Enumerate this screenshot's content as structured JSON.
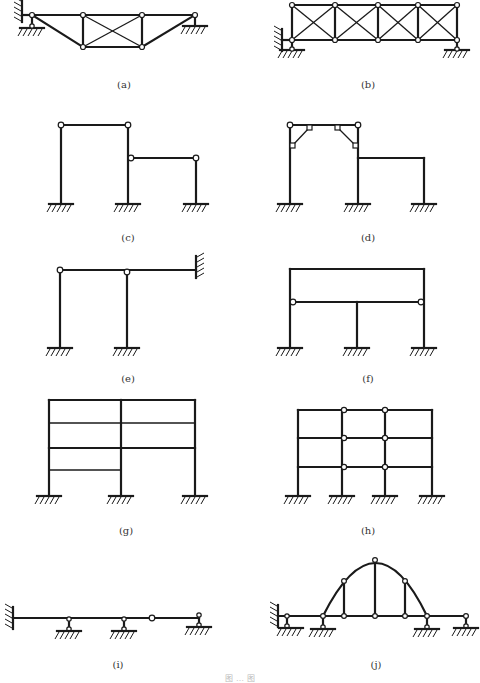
{
  "figure": {
    "caption": "图 … 图",
    "panels": [
      {
        "id": "a",
        "label": "(a)",
        "type": "truss",
        "description": "Truss with trapezoidal profile, X-braced middle panel, pinned support with horizontal link at left, roller at right"
      },
      {
        "id": "b",
        "label": "(b)",
        "type": "truss",
        "description": "Four-panel X-braced parallel chord truss, left support with horizontal link and vertical link, right roller"
      },
      {
        "id": "c",
        "label": "(c)",
        "type": "frame",
        "description": "Two-bay stepped frame with fixed column bases, hinged beam ends"
      },
      {
        "id": "d",
        "label": "(d)",
        "type": "frame",
        "description": "Two-bay stepped frame with knee braces in left bay, hinged top corners"
      },
      {
        "id": "e",
        "label": "(e)",
        "type": "frame",
        "description": "Beam fixed at right wall, supported on two fixed-base columns with hinges"
      },
      {
        "id": "f",
        "label": "(f)",
        "type": "frame",
        "description": "Two-story frame, three fixed-base columns, hinged lower beam at outer columns"
      },
      {
        "id": "g",
        "label": "(g)",
        "type": "frame",
        "description": "Two-bay multi-story frame with uneven floor levels, fixed bases"
      },
      {
        "id": "h",
        "label": "(h)",
        "type": "frame",
        "description": "Three-bay three-story frame with hinged middle-bay beams, fixed bases"
      },
      {
        "id": "i",
        "label": "(i)",
        "type": "beam",
        "description": "Continuous beam fixed at left wall, three link supports, one internal hinge"
      },
      {
        "id": "j",
        "label": "(j)",
        "type": "arch",
        "description": "Tied arch with hangers over beam, multiple link supports"
      }
    ]
  }
}
